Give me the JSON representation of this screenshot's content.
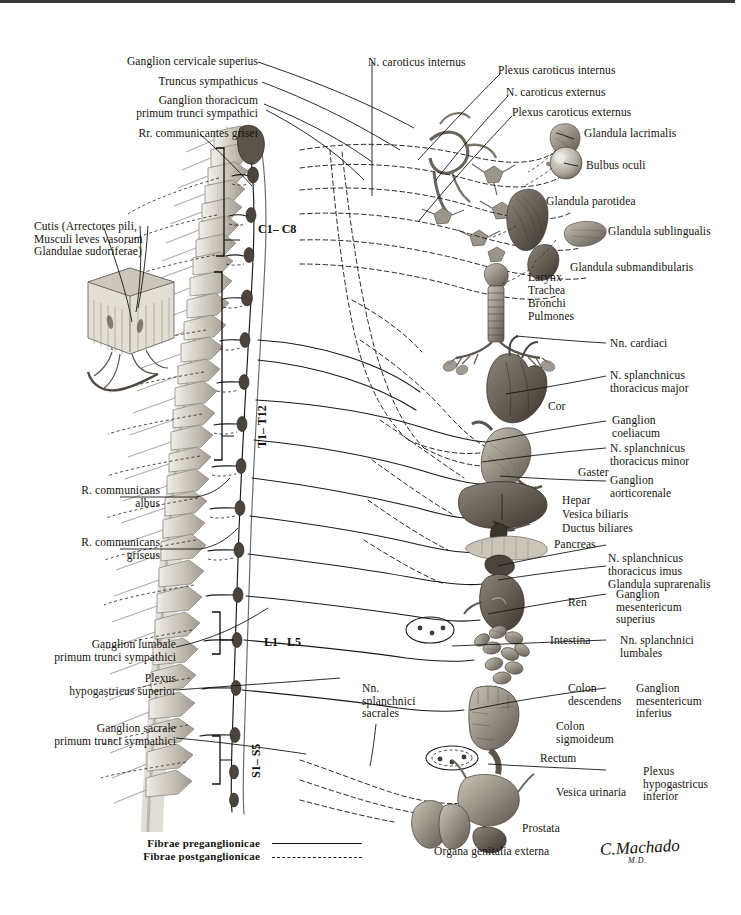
{
  "plate": {
    "title": "Sympathetic and parasympathetic autonomic nervous system plate",
    "signature": "C.Machado",
    "signature_sub": "M.D."
  },
  "legend": {
    "preganglionic": "Fibrae preganglionicae",
    "postganglionic": "Fibrae postganglionicae"
  },
  "spinal_levels": [
    {
      "label": "C1– C8"
    },
    {
      "label": "T1– T12"
    },
    {
      "label": "L1– L5"
    },
    {
      "label": "S1– S5"
    }
  ],
  "labels_left_top": [
    {
      "text": "Ganglion cervicale superius"
    },
    {
      "text": "Truncus sympathicus"
    },
    {
      "text": "Ganglion thoracicum\nprimum trunci sympathici"
    },
    {
      "text": "Rr. communicantes grisei"
    }
  ],
  "labels_left_mid": [
    {
      "text": "Cutis (Arrectores pili,\nMusculi leves vasorum\nGlandulae sudoriferae)"
    },
    {
      "text": "R. communicans\nalbus"
    },
    {
      "text": "R. communicans\ngriseus"
    }
  ],
  "labels_left_bottom": [
    {
      "text": "Ganglion lumbale\nprimum trunci sympathici"
    },
    {
      "text": "Plexus\nhypogastricus superior"
    },
    {
      "text": "Ganglion sacrale\nprimum trunci sympathici"
    }
  ],
  "labels_center": [
    {
      "text": "Nn.\nsplanchnici\nsacrales"
    }
  ],
  "labels_top_right": [
    {
      "text": "N. caroticus internus"
    },
    {
      "text": "Plexus caroticus internus"
    },
    {
      "text": "N. caroticus externus"
    },
    {
      "text": "Plexus caroticus externus"
    },
    {
      "text": "Glandula lacrimalis"
    },
    {
      "text": "Bulbus oculi"
    },
    {
      "text": "Glandula parotidea"
    },
    {
      "text": "Glandula sublingualis"
    },
    {
      "text": "Glandula submandibularis"
    }
  ],
  "labels_thorax": [
    {
      "text": "Larynx"
    },
    {
      "text": "Trachea"
    },
    {
      "text": "Bronchi"
    },
    {
      "text": "Pulmones"
    },
    {
      "text": "Nn. cardiaci"
    },
    {
      "text": "N. splanchnicus\nthoracicus major"
    },
    {
      "text": "Cor"
    }
  ],
  "labels_abdomen": [
    {
      "text": "Ganglion\ncoeliacum"
    },
    {
      "text": "N. splanchnicus\nthoracicus minor"
    },
    {
      "text": "Gaster"
    },
    {
      "text": "Ganglion\naorticorenale"
    },
    {
      "text": "Hepar"
    },
    {
      "text": "Vesica biliaris"
    },
    {
      "text": "Ductus biliares"
    },
    {
      "text": "Pancreas"
    },
    {
      "text": "N. splanchnicus\nthoracicus imus"
    },
    {
      "text": "Glandula suprarenalis"
    },
    {
      "text": "Ren"
    },
    {
      "text": "Ganglion\nmesentericum\nsuperius"
    },
    {
      "text": "Intestina"
    },
    {
      "text": "Nn. splanchnici\nlumbales"
    }
  ],
  "labels_pelvis": [
    {
      "text": "Colon\ndescendens"
    },
    {
      "text": "Ganglion\nmesentericum\ninferius"
    },
    {
      "text": "Colon\nsigmoideum"
    },
    {
      "text": "Rectum"
    },
    {
      "text": "Plexus\nhypogastricus\ninferior"
    },
    {
      "text": "Vesica urinaria"
    },
    {
      "text": "Prostata"
    },
    {
      "text": "Organa genitalia externa"
    }
  ],
  "colors": {
    "ink": "#15120f",
    "rule": "#3a3a38",
    "bone": "#d9d4ca",
    "organ_mid": "#8f8980",
    "organ_dark": "#5b554d",
    "background": "#ffffff"
  }
}
